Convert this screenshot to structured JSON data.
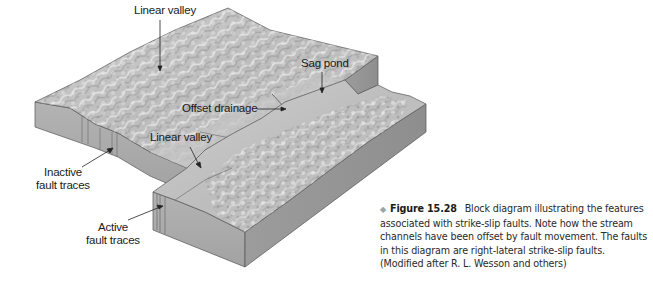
{
  "figure": {
    "labels": {
      "linear_valley_top": "Linear valley",
      "sag_pond": "Sag pond",
      "offset_drainage": "Offset drainage",
      "linear_valley_lower": "Linear valley",
      "inactive_fault_traces_line1": "Inactive",
      "inactive_fault_traces_line2": "fault traces",
      "active_fault_traces_line1": "Active",
      "active_fault_traces_line2": "fault traces"
    },
    "caption": {
      "bullet": "◆",
      "figure_number": "Figure 15.28",
      "text": "Block diagram illustrating the features associated with strike-slip faults. Note how the stream channels have been offset by fault movement. The faults in this diagram are right-lateral strike-slip faults. (Modified after R. L. Wesson and others)"
    },
    "colors": {
      "block_side": "#a9a9a9",
      "block_side_dark": "#8f8f8f",
      "terrain_light": "#d6d6d6",
      "terrain_mid": "#b8b8b8",
      "outline": "#4a4a4a"
    }
  }
}
